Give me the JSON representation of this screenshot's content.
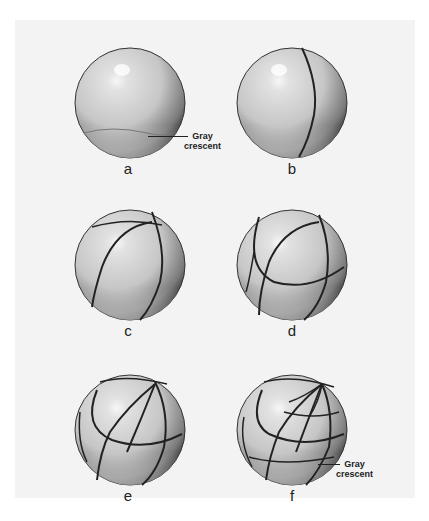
{
  "figure": {
    "panels": [
      {
        "id": "a",
        "label": "a",
        "cells": 1,
        "annotation": "Gray crescent"
      },
      {
        "id": "b",
        "label": "b",
        "cells": 2
      },
      {
        "id": "c",
        "label": "c",
        "cells": 4
      },
      {
        "id": "d",
        "label": "d",
        "cells": 8
      },
      {
        "id": "e",
        "label": "e",
        "cells": 16
      },
      {
        "id": "f",
        "label": "f",
        "cells": 32,
        "annotation": "Gray crescent"
      }
    ],
    "annotations": {
      "a": {
        "line1": "Gray",
        "line2": "crescent"
      },
      "f": {
        "line1": "Gray",
        "line2": "crescent"
      }
    }
  },
  "colors": {
    "background": "#f3f3f3",
    "sphere_light": "#e6e6e6",
    "sphere_mid": "#b8b8b8",
    "sphere_dark": "#3a3a3a",
    "line": "#222222"
  }
}
